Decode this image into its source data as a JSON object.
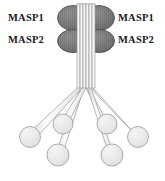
{
  "figure": {
    "name": "mbl-masp-complex-diagram",
    "background_color": "#ffffff"
  },
  "labels": {
    "left_top": "MASP1",
    "left_bottom": "MASP2",
    "right_top": "MASP1",
    "right_bottom": "MASP2",
    "text_color": "#1a1a1a"
  },
  "colors": {
    "masp_oval_fill": "#7d7d7d",
    "masp_oval_fill_light": "#8e8e8e",
    "masp_oval_stroke": "#4a4a4a",
    "head_fill": "#e6e6e6",
    "head_fill_light": "#f2f2f2",
    "head_stroke": "#9a9a9a",
    "stalk_fill": "#f4f4f4",
    "stalk_stroke": "#9a9a9a",
    "bundle_highlight": "#ffffff"
  },
  "masp_ovals": [
    {
      "id": "masp1-left-oval",
      "cx": 73,
      "cy": 18,
      "rx": 15.5,
      "ry": 12.5,
      "label_ref": "left_top"
    },
    {
      "id": "masp1-right-oval",
      "cx": 99,
      "cy": 18,
      "rx": 15.5,
      "ry": 12.5,
      "label_ref": "right_top"
    },
    {
      "id": "masp2-left-oval",
      "cx": 73,
      "cy": 41,
      "rx": 15.5,
      "ry": 11.5,
      "label_ref": "left_bottom"
    },
    {
      "id": "masp2-right-oval",
      "cx": 99,
      "cy": 41,
      "rx": 15.5,
      "ry": 11.5,
      "label_ref": "right_bottom"
    }
  ],
  "stalks": [
    {
      "id": "stalk-1",
      "top_x": 78.5,
      "top_y": 5,
      "pivot_x": 80.5,
      "pivot_y": 88,
      "head_x": 30,
      "head_y": 137,
      "width": 3.0
    },
    {
      "id": "stalk-2",
      "top_x": 81.5,
      "top_y": 5,
      "pivot_x": 82.0,
      "pivot_y": 88,
      "head_x": 58,
      "head_y": 155,
      "width": 3.0
    },
    {
      "id": "stalk-3",
      "top_x": 84.5,
      "top_y": 5,
      "pivot_x": 83.5,
      "pivot_y": 88,
      "head_x": 63,
      "head_y": 124,
      "width": 3.0
    },
    {
      "id": "stalk-4",
      "top_x": 87.5,
      "top_y": 5,
      "pivot_x": 86.0,
      "pivot_y": 88,
      "head_x": 107,
      "head_y": 124,
      "width": 3.0
    },
    {
      "id": "stalk-5",
      "top_x": 90.5,
      "top_y": 5,
      "pivot_x": 88.0,
      "pivot_y": 88,
      "head_x": 112,
      "head_y": 155,
      "width": 3.0
    },
    {
      "id": "stalk-6",
      "top_x": 93.5,
      "top_y": 5,
      "pivot_x": 89.5,
      "pivot_y": 88,
      "head_x": 138,
      "head_y": 137,
      "width": 3.0
    }
  ],
  "heads": [
    {
      "id": "head-1",
      "cx": 30,
      "cy": 137,
      "r": 10.5
    },
    {
      "id": "head-2",
      "cx": 58,
      "cy": 155,
      "r": 11.0
    },
    {
      "id": "head-3",
      "cx": 63,
      "cy": 124,
      "r": 10.0
    },
    {
      "id": "head-4",
      "cx": 107,
      "cy": 124,
      "r": 10.0
    },
    {
      "id": "head-5",
      "cx": 112,
      "cy": 155,
      "r": 11.0
    },
    {
      "id": "head-6",
      "cx": 138,
      "cy": 137,
      "r": 10.5
    }
  ],
  "counts": {
    "masp_ovals": 4,
    "stalks": 6,
    "heads": 6
  }
}
